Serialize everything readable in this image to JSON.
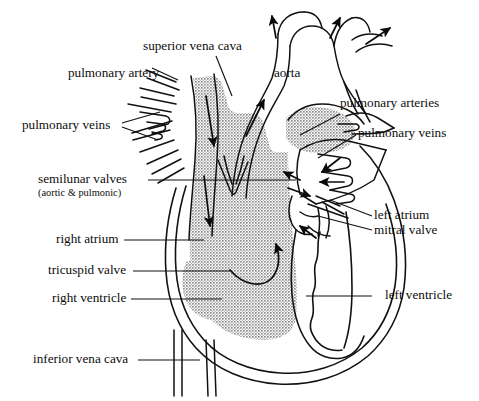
{
  "figure": {
    "type": "anatomical-diagram",
    "background_color": "#ffffff",
    "ink_color": "#111111",
    "shading_color": "#a0a0a0",
    "shading_description": "stippled gray fill marking deoxygenated right-heart chambers and great veins"
  },
  "labels": {
    "superior_vena_cava": "superior vena cava",
    "pulmonary_artery": "pulmonary artery",
    "pulmonary_veins_left": "pulmonary veins",
    "semilunar_valves": "semilunar valves",
    "semilunar_valves_sub": "(aortic & pulmonic)",
    "right_atrium": "right atrium",
    "tricuspid_valve": "tricuspid valve",
    "right_ventricle": "right ventricle",
    "inferior_vena_cava": "inferior vena cava",
    "aorta": "aorta",
    "pulmonary_arteries_right": "pulmonary arteries",
    "pulmonary_veins_right": "pulmonary veins",
    "left_atrium": "left atrium",
    "mitral_valve": "mitral valve",
    "left_ventricle": "left ventricle"
  },
  "structures": [
    {
      "name": "superior-vena-cava",
      "side": "right-heart",
      "shaded": true
    },
    {
      "name": "inferior-vena-cava",
      "side": "right-heart",
      "shaded": true
    },
    {
      "name": "right-atrium",
      "side": "right-heart",
      "shaded": true
    },
    {
      "name": "right-ventricle",
      "side": "right-heart",
      "shaded": true
    },
    {
      "name": "pulmonary-artery",
      "side": "right-heart",
      "shaded": true
    },
    {
      "name": "aorta",
      "side": "left-heart",
      "shaded": false
    },
    {
      "name": "left-atrium",
      "side": "left-heart",
      "shaded": false
    },
    {
      "name": "left-ventricle",
      "side": "left-heart",
      "shaded": false
    },
    {
      "name": "pulmonary-veins",
      "side": "left-heart",
      "shaded": false
    },
    {
      "name": "tricuspid-valve",
      "side": "right-heart",
      "shaded": false
    },
    {
      "name": "mitral-valve",
      "side": "left-heart",
      "shaded": false
    },
    {
      "name": "semilunar-valves",
      "side": "both",
      "shaded": false
    }
  ],
  "flow_arrows": [
    {
      "name": "svc-inflow-upper",
      "direction": "down",
      "region": "superior vena cava"
    },
    {
      "name": "svc-inflow-lower",
      "direction": "down",
      "region": "right atrium"
    },
    {
      "name": "tricuspid-flow",
      "direction": "curved-right-up",
      "region": "right atrium to right ventricle"
    },
    {
      "name": "rv-outflow",
      "direction": "up",
      "region": "right ventricle to pulmonary artery"
    },
    {
      "name": "aortic-outflow",
      "direction": "up-right",
      "region": "left ventricle to aorta"
    },
    {
      "name": "aortic-arch-branch-1",
      "direction": "up",
      "region": "brachiocephalic"
    },
    {
      "name": "aortic-arch-branch-2",
      "direction": "up-right",
      "region": "left common carotid"
    },
    {
      "name": "aortic-arch-branch-3",
      "direction": "right",
      "region": "left subclavian"
    },
    {
      "name": "pulmonary-artery-branch",
      "direction": "up-right",
      "region": "right pulmonary artery"
    },
    {
      "name": "pulmonary-vein-inflow-1",
      "direction": "down-left",
      "region": "left atrium"
    },
    {
      "name": "pulmonary-vein-inflow-2",
      "direction": "left",
      "region": "left atrium"
    },
    {
      "name": "pulmonary-vein-inflow-3",
      "direction": "right",
      "region": "left atrium"
    },
    {
      "name": "mitral-flow",
      "direction": "up-left",
      "region": "left atrium to left ventricle"
    },
    {
      "name": "la-flow",
      "direction": "up-left",
      "region": "left atrium"
    }
  ]
}
